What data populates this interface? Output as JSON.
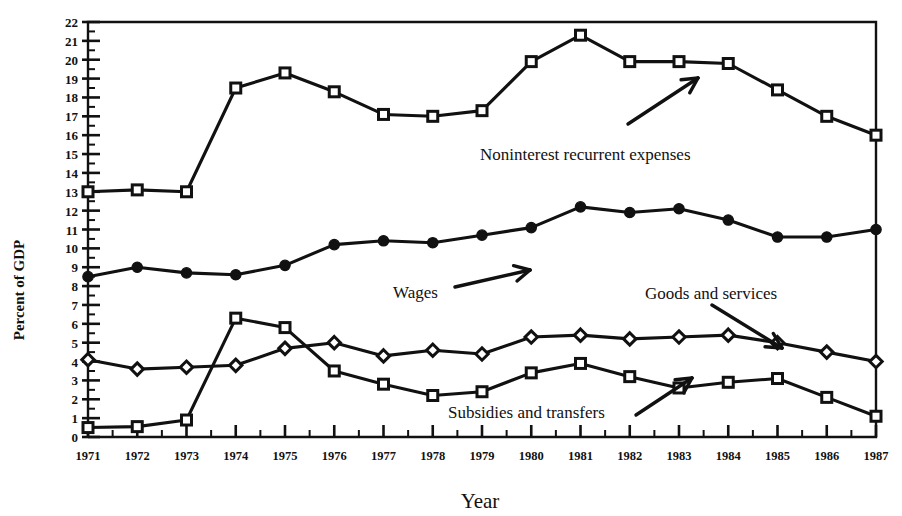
{
  "chart_data": {
    "type": "line",
    "title": "",
    "xlabel": "Year",
    "ylabel": "Percent of GDP",
    "xlim": [
      1971,
      1987
    ],
    "ylim": [
      0,
      22
    ],
    "x": [
      1971,
      1972,
      1973,
      1974,
      1975,
      1976,
      1977,
      1978,
      1979,
      1980,
      1981,
      1982,
      1983,
      1984,
      1985,
      1986,
      1987
    ],
    "xticklabels": [
      "1971",
      "1972",
      "1973",
      "1974",
      "1975",
      "1976",
      "1977",
      "1978",
      "1979",
      "1980",
      "1981",
      "1982",
      "1983",
      "1984",
      "1985",
      "1986",
      "1987"
    ],
    "yticklabels": [
      "0",
      "1",
      "2",
      "3",
      "4",
      "5",
      "6",
      "7",
      "8",
      "9",
      "10",
      "11",
      "12",
      "13",
      "14",
      "15",
      "16",
      "17",
      "18",
      "19",
      "20",
      "21",
      "22"
    ],
    "ytick_step": 1,
    "yminor_step": 0.5,
    "xminor_step": 0.5,
    "grid": false,
    "legend_position": "inline-annotations",
    "series": [
      {
        "name": "Noninterest recurrent expenses",
        "marker": "open-square",
        "values": [
          13.0,
          13.1,
          13.0,
          18.5,
          19.3,
          18.3,
          17.1,
          17.0,
          17.3,
          19.9,
          21.3,
          19.9,
          19.9,
          19.8,
          18.4,
          17.0,
          16.0
        ]
      },
      {
        "name": "Wages",
        "marker": "filled-circle",
        "values": [
          8.5,
          9.0,
          8.7,
          8.6,
          9.1,
          10.2,
          10.4,
          10.3,
          10.7,
          11.1,
          12.2,
          11.9,
          12.1,
          11.5,
          10.6,
          10.6,
          11.0
        ]
      },
      {
        "name": "Goods and services",
        "marker": "open-diamond",
        "values": [
          4.1,
          3.6,
          3.7,
          3.8,
          4.7,
          5.0,
          4.3,
          4.6,
          4.4,
          5.3,
          5.4,
          5.2,
          5.3,
          5.4,
          5.0,
          4.5,
          4.0
        ]
      },
      {
        "name": "Subsidies and transfers",
        "marker": "open-square",
        "values": [
          0.5,
          0.55,
          0.9,
          6.3,
          5.8,
          3.5,
          2.8,
          2.2,
          2.4,
          3.4,
          3.9,
          3.2,
          2.6,
          2.9,
          3.1,
          2.1,
          1.1
        ]
      }
    ],
    "annotations": [
      {
        "text": "Noninterest recurrent expenses",
        "x_px": 480,
        "y_px": 160,
        "arrow": {
          "x1": 628,
          "y1": 124,
          "x2": 698,
          "y2": 78
        }
      },
      {
        "text": "Wages",
        "x_px": 393,
        "y_px": 298,
        "arrow": {
          "x1": 455,
          "y1": 287,
          "x2": 530,
          "y2": 270
        }
      },
      {
        "text": "Goods and services",
        "x_px": 645,
        "y_px": 299,
        "arrow": {
          "x1": 712,
          "y1": 305,
          "x2": 782,
          "y2": 348
        }
      },
      {
        "text": "Subsidies and transfers",
        "x_px": 448,
        "y_px": 418,
        "arrow": {
          "x1": 636,
          "y1": 415,
          "x2": 692,
          "y2": 378
        }
      }
    ],
    "colors": {
      "line": "#111111",
      "marker_fill": "#ffffff",
      "background": "#ffffff"
    }
  }
}
